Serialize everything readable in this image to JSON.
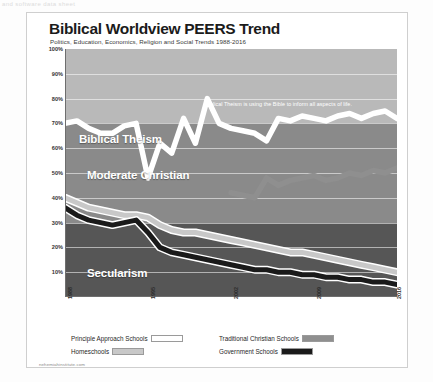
{
  "top_strip_text": "and software data sheet",
  "header": {
    "title": "Biblical Worldview PEERS Trend",
    "subtitle": "Politics, Education, Economics, Religion and Social Trends 1988-2016"
  },
  "footer": {
    "source": "nehemiahinstitute.com"
  },
  "bands": [
    {
      "name": "Biblical Theism",
      "label": "Biblical Theism",
      "range": [
        70,
        100
      ],
      "color": "#b9b9b9"
    },
    {
      "name": "Moderate Christian",
      "label": "Moderate Christian",
      "range": [
        30,
        70
      ],
      "color": "#8a8a8a"
    },
    {
      "name": "Secularism",
      "label": "Secularism",
      "range": [
        0,
        30
      ],
      "color": "#565656"
    }
  ],
  "annotation": "Biblical Theism is using the Bible to inform all aspects of life.",
  "legend": {
    "items": [
      {
        "label": "Principle Approach Schools",
        "color": "#ffffff"
      },
      {
        "label": "Traditional Christian Schools",
        "color": "#8f8f8f"
      },
      {
        "label": "Homeschools",
        "color": "#c8c8c8"
      },
      {
        "label": "Government Schools",
        "color": "#1a1a1a"
      }
    ]
  },
  "chart_data": {
    "type": "line",
    "title": "Biblical Worldview PEERS Trend",
    "subtitle": "Politics, Education, Economics, Religion and Social Trends 1988-2016",
    "xlabel": "",
    "ylabel": "",
    "ylim": [
      0,
      100
    ],
    "xlim": [
      1988,
      2016
    ],
    "ytick_labels": [
      "100%",
      "90%",
      "80%",
      "70%",
      "60%",
      "50%",
      "40%",
      "30%",
      "20%",
      "10%"
    ],
    "yticks": [
      100,
      90,
      80,
      70,
      60,
      50,
      40,
      30,
      20,
      10
    ],
    "xtick_labels": [
      "1988",
      "1995",
      "2002",
      "2009",
      "2016"
    ],
    "xticks": [
      1988,
      1995,
      2002,
      2009,
      2016
    ],
    "grid": true,
    "legend_position": "below",
    "x": [
      1988,
      1989,
      1990,
      1991,
      1992,
      1993,
      1994,
      1995,
      1996,
      1997,
      1998,
      1999,
      2000,
      2001,
      2002,
      2003,
      2004,
      2005,
      2006,
      2007,
      2008,
      2009,
      2010,
      2011,
      2012,
      2013,
      2014,
      2015,
      2016
    ],
    "series": [
      {
        "name": "Principle Approach Schools",
        "color": "#ffffff",
        "values": [
          70,
          71,
          68,
          66,
          66,
          69,
          70,
          48,
          62,
          58,
          72,
          62,
          80,
          70,
          68,
          67,
          66,
          63,
          72,
          71,
          73,
          72,
          71,
          73,
          74,
          72,
          74,
          75,
          72
        ]
      },
      {
        "name": "Traditional Christian Schools",
        "color": "#8f8f8f",
        "values": [
          null,
          null,
          null,
          null,
          null,
          null,
          null,
          null,
          null,
          null,
          null,
          null,
          null,
          null,
          42,
          41,
          40,
          48,
          45,
          47,
          48,
          49,
          47,
          48,
          50,
          49,
          51,
          50,
          52
        ]
      },
      {
        "name": "Homeschools",
        "color": "#c8c8c8",
        "values": [
          40,
          38,
          36,
          35,
          34,
          33,
          33,
          32,
          29,
          27,
          26,
          26,
          25,
          24,
          23,
          22,
          21,
          20,
          19,
          18,
          18,
          17,
          16,
          15,
          14,
          13,
          12,
          11,
          10
        ]
      },
      {
        "name": "Government Schools",
        "color": "#1a1a1a",
        "values": [
          36,
          33,
          31,
          30,
          29,
          30,
          31,
          26,
          20,
          18,
          17,
          16,
          15,
          14,
          13,
          12,
          11,
          11,
          10,
          10,
          9,
          9,
          8,
          8,
          7,
          7,
          6,
          6,
          5
        ]
      }
    ]
  }
}
